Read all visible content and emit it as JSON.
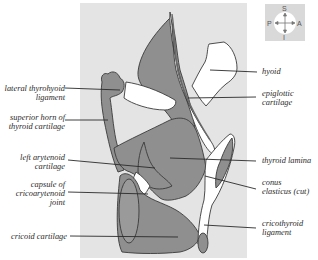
{
  "figure": {
    "colors": {
      "panel_background": "#e4e4e4",
      "cartilage_fill": "#8f8f8f",
      "light_fill": "#ffffff",
      "outline": "#3a3a3a",
      "leader_line": "#2a2a2a"
    }
  },
  "compass": {
    "superior": "S",
    "inferior": "I",
    "posterior": "P",
    "anterior": "A",
    "icon": "orientation-compass-icon"
  },
  "labels_left": [
    {
      "id": "lateral-thyrohyoid-ligament",
      "line1": "lateral thyrohyoid",
      "line2": "ligament"
    },
    {
      "id": "superior-horn-of-thyroid-cartilage",
      "line1": "superior horn of",
      "line2": "thyroid cartilage"
    },
    {
      "id": "left-arytenoid-cartilage",
      "line1": "left arytenoid",
      "line2": "cartilage"
    },
    {
      "id": "capsule-of-cricoarytenoid-joint",
      "line1": "capsule of",
      "line2": "cricoarytenoid",
      "line3": "joint"
    },
    {
      "id": "cricoid-cartilage",
      "line1": "cricoid cartilage"
    }
  ],
  "labels_right": [
    {
      "id": "hyoid",
      "line1": "hyoid"
    },
    {
      "id": "epiglottic-cartilage",
      "line1": "epiglottic",
      "line2": "cartilage"
    },
    {
      "id": "thyroid-lamina",
      "line1": "thyroid lamina"
    },
    {
      "id": "conus-elasticus",
      "line1": "conus",
      "line2": "elasticus (cut)"
    },
    {
      "id": "cricothyroid-ligament",
      "line1": "cricothyroid",
      "line2": "ligament"
    }
  ]
}
